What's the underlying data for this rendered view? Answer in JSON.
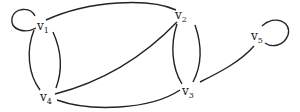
{
  "diagram": {
    "type": "undirected-multigraph",
    "vertices": [
      {
        "id": "v1",
        "letter": "v",
        "sub": "1",
        "x": 42,
        "y": 26
      },
      {
        "id": "v2",
        "letter": "v",
        "sub": "2",
        "x": 180,
        "y": 16
      },
      {
        "id": "v3",
        "letter": "v",
        "sub": "3",
        "x": 188,
        "y": 92
      },
      {
        "id": "v4",
        "letter": "v",
        "sub": "4",
        "x": 45,
        "y": 98
      },
      {
        "id": "v5",
        "letter": "v",
        "sub": "5",
        "x": 256,
        "y": 37
      }
    ],
    "edges": [
      {
        "from": "v1",
        "to": "v1",
        "kind": "loop"
      },
      {
        "from": "v1",
        "to": "v2",
        "kind": "arc"
      },
      {
        "from": "v1",
        "to": "v4",
        "kind": "arc"
      },
      {
        "from": "v1",
        "to": "v4",
        "kind": "arc"
      },
      {
        "from": "v2",
        "to": "v4",
        "kind": "arc"
      },
      {
        "from": "v2",
        "to": "v3",
        "kind": "arc"
      },
      {
        "from": "v2",
        "to": "v3",
        "kind": "arc"
      },
      {
        "from": "v4",
        "to": "v3",
        "kind": "arc"
      },
      {
        "from": "v3",
        "to": "v5",
        "kind": "arc"
      },
      {
        "from": "v5",
        "to": "v5",
        "kind": "loop"
      }
    ],
    "stroke_color": "#222222"
  }
}
